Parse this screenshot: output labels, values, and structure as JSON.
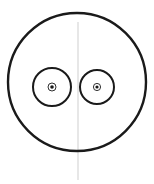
{
  "drawing": {
    "subject": "face-sketch",
    "colors": {
      "background": "#ffffff",
      "ink": "#1a1a1a",
      "guideline": "#cfcfcf"
    },
    "head": {
      "cx": 77,
      "cy": 82,
      "rx": 69,
      "ry": 69
    },
    "guideline": {
      "x": 78,
      "y1": 22,
      "y2": 180
    },
    "eyes": [
      {
        "cx": 52,
        "cy": 87,
        "r": 19,
        "pupil_ring_r": 4,
        "pupil_r": 1.8
      },
      {
        "cx": 97,
        "cy": 87,
        "r": 17,
        "pupil_ring_r": 3.6,
        "pupil_r": 1.6
      }
    ]
  }
}
